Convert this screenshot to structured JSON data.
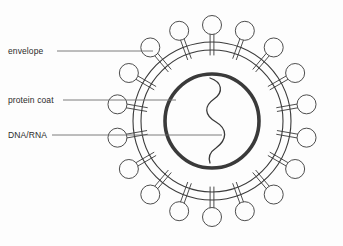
{
  "diagram": {
    "background_color": "#fdfdfd",
    "line_color": "#3a3a3a",
    "coat_color": "#3a3a3a",
    "leader_color": "#6e6e6e",
    "labels": [
      {
        "id": "envelope",
        "text": "envelope",
        "x": 8,
        "y": 46,
        "leader_from_x": 57,
        "leader_to_x": 153,
        "leader_y": 51
      },
      {
        "id": "protein-coat",
        "text": "protein coat",
        "x": 8,
        "y": 95,
        "leader_from_x": 63,
        "leader_to_x": 176,
        "leader_y": 100
      },
      {
        "id": "dna-rna",
        "text": "DNA/RNA",
        "x": 8,
        "y": 130,
        "leader_from_x": 52,
        "leader_to_x": 222,
        "leader_y": 135
      }
    ],
    "envelope": {
      "center_x": 212,
      "center_y": 121,
      "outer_radius": 79,
      "inner_radius": 71,
      "stroke_width": 1.1
    },
    "protein_coat": {
      "center_x": 212,
      "center_y": 121,
      "radius": 47,
      "stroke_width": 3.6
    },
    "spikes": {
      "count": 18,
      "head_radius": 9.5,
      "stem_inner_radius": 66,
      "stem_outer_radius": 88,
      "stem_half_width": 1.9,
      "stroke_width": 0.9
    },
    "nucleic_acid": {
      "description": "S-shaped squiggle representing genetic material",
      "path": "M 210 78 C 222 82, 224 92, 214 99 C 204 106, 204 115, 216 122 C 228 129, 227 140, 216 148 C 210 152, 208 157, 210 163",
      "stroke_width": 1.3
    }
  }
}
